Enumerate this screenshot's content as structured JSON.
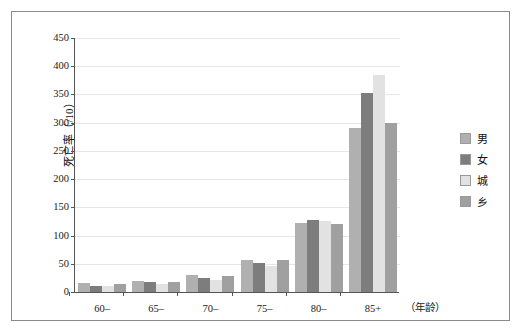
{
  "chart_data": {
    "type": "bar",
    "title": "",
    "xlabel": "（年龄）",
    "ylabel": "死亡率（/10）",
    "ylim": [
      0,
      450
    ],
    "ytick_step": 50,
    "grid": true,
    "legend_position": "right",
    "categories": [
      "60–",
      "65–",
      "70–",
      "75–",
      "80–",
      "85+"
    ],
    "yticks": [
      "450",
      "400",
      "350",
      "300",
      "250",
      "200",
      "150",
      "100",
      "50",
      "0"
    ],
    "series": [
      {
        "name": "男",
        "color": "#b0b0b0",
        "values": [
          16,
          20,
          30,
          57,
          122,
          290
        ]
      },
      {
        "name": "女",
        "color": "#7d7d7d",
        "values": [
          11,
          17,
          25,
          52,
          127,
          353
        ]
      },
      {
        "name": "城",
        "color": "#e2e2e2",
        "values": [
          10,
          14,
          22,
          46,
          125,
          385
        ]
      },
      {
        "name": "乡",
        "color": "#a0a0a0",
        "values": [
          14,
          18,
          28,
          57,
          121,
          300
        ]
      }
    ]
  },
  "legend": {
    "items": [
      {
        "label": "男"
      },
      {
        "label": "女"
      },
      {
        "label": "城"
      },
      {
        "label": "乡"
      }
    ]
  }
}
